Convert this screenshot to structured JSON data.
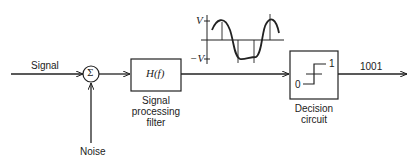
{
  "diagram": {
    "type": "block-diagram",
    "inputs": {
      "signal_label": "Signal",
      "noise_label": "Noise"
    },
    "summer": {
      "symbol": "Σ"
    },
    "filter": {
      "transfer_function": "H(f)",
      "caption_line1": "Signal",
      "caption_line2": "processing",
      "caption_line3": "filter"
    },
    "waveform": {
      "v_pos_label": "V",
      "v_neg_label": "−V"
    },
    "decision": {
      "low_label": "0",
      "high_label": "1",
      "caption_line1": "Decision",
      "caption_line2": "circuit"
    },
    "output": {
      "bits_label": "1001"
    },
    "colors": {
      "stroke": "#222222",
      "text": "#222222",
      "background": "#ffffff"
    }
  }
}
